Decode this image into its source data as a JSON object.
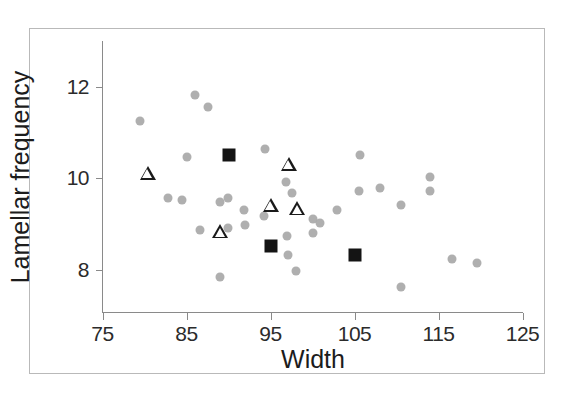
{
  "figure": {
    "background": "#ffffff",
    "frame_color": "#b9b9b9",
    "axis_color": "#8a8a8a"
  },
  "chart_data": {
    "type": "scatter",
    "title": "",
    "xlabel": "Width",
    "ylabel": "Lamellar frequency",
    "xlim": [
      75,
      125
    ],
    "ylim": [
      7.4,
      12.4
    ],
    "xticks": [
      75,
      85,
      95,
      105,
      115,
      125
    ],
    "yticks": [
      8,
      10,
      12
    ],
    "xtick_labels": [
      "75",
      "85",
      "95",
      "105",
      "115",
      "125"
    ],
    "ytick_labels": [
      "8",
      "10",
      "12"
    ],
    "grid": false,
    "legend": null,
    "colors": {
      "gray_circle": "#a8a8a8",
      "black_square": "#141414",
      "open_triangle": "#1a1a1a"
    },
    "series": [
      {
        "name": "gray-circles",
        "marker": "circle",
        "fill": "#a8a8a8",
        "points": [
          {
            "x": 79.5,
            "y": 11.25
          },
          {
            "x": 86.0,
            "y": 11.82
          },
          {
            "x": 87.5,
            "y": 11.55
          },
          {
            "x": 105.6,
            "y": 10.52
          },
          {
            "x": 85.0,
            "y": 10.47
          },
          {
            "x": 94.4,
            "y": 10.63
          },
          {
            "x": 100.1,
            "y": 9.12
          },
          {
            "x": 100.9,
            "y": 9.02
          },
          {
            "x": 84.5,
            "y": 9.53
          },
          {
            "x": 82.8,
            "y": 9.58
          },
          {
            "x": 89.0,
            "y": 9.48
          },
          {
            "x": 89.9,
            "y": 9.58
          },
          {
            "x": 96.9,
            "y": 9.92
          },
          {
            "x": 97.6,
            "y": 9.68
          },
          {
            "x": 102.9,
            "y": 9.32
          },
          {
            "x": 108.0,
            "y": 9.8
          },
          {
            "x": 105.5,
            "y": 9.72
          },
          {
            "x": 110.5,
            "y": 9.42
          },
          {
            "x": 114.0,
            "y": 10.02
          },
          {
            "x": 114.0,
            "y": 9.72
          },
          {
            "x": 86.6,
            "y": 8.87
          },
          {
            "x": 89.9,
            "y": 8.92
          },
          {
            "x": 92.0,
            "y": 8.98
          },
          {
            "x": 97.0,
            "y": 8.75
          },
          {
            "x": 100.0,
            "y": 8.8
          },
          {
            "x": 97.1,
            "y": 8.32
          },
          {
            "x": 89.0,
            "y": 7.85
          },
          {
            "x": 98.0,
            "y": 7.97
          },
          {
            "x": 110.5,
            "y": 7.62
          },
          {
            "x": 116.6,
            "y": 8.25
          },
          {
            "x": 119.6,
            "y": 8.15
          },
          {
            "x": 91.8,
            "y": 9.32
          },
          {
            "x": 94.2,
            "y": 9.18
          }
        ]
      },
      {
        "name": "black-squares",
        "marker": "square",
        "fill": "#141414",
        "points": [
          {
            "x": 90.0,
            "y": 10.5
          },
          {
            "x": 95.0,
            "y": 8.52
          },
          {
            "x": 105.0,
            "y": 8.32
          }
        ]
      },
      {
        "name": "open-triangles",
        "marker": "triangle-open",
        "fill": "#ffffff",
        "edge": "#1a1a1a",
        "points": [
          {
            "x": 80.4,
            "y": 10.12
          },
          {
            "x": 97.2,
            "y": 10.32
          },
          {
            "x": 95.0,
            "y": 9.42
          },
          {
            "x": 98.2,
            "y": 9.35
          },
          {
            "x": 89.0,
            "y": 8.85
          }
        ]
      }
    ]
  }
}
